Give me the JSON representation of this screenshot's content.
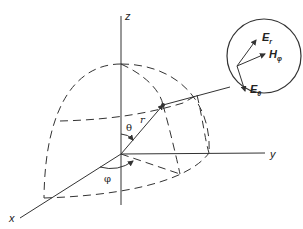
{
  "diagram": {
    "type": "spherical-coordinate-system",
    "axes": {
      "x_label": "x",
      "y_label": "y",
      "z_label": "z"
    },
    "angles": {
      "theta_label": "θ",
      "phi_label": "φ"
    },
    "radius_label": "r",
    "inset": {
      "vectors": [
        {
          "name": "E_r",
          "base": "E",
          "sub": "r"
        },
        {
          "name": "H_phi",
          "base": "H",
          "sub": "φ"
        },
        {
          "name": "E_theta",
          "base": "E",
          "sub": "θ"
        }
      ]
    },
    "colors": {
      "line": "#333333",
      "background": "#ffffff"
    }
  }
}
